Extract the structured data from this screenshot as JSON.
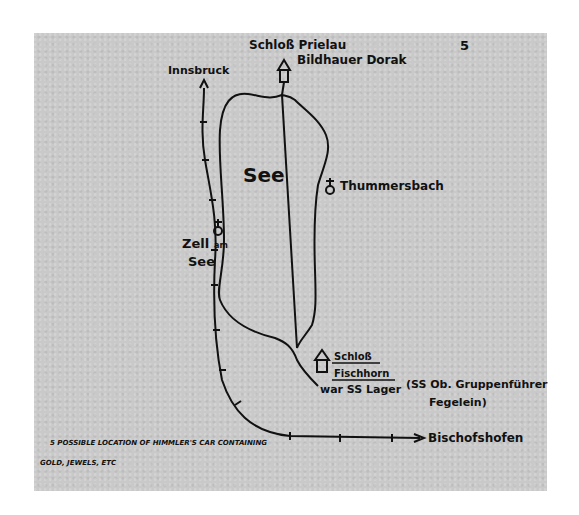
{
  "map": {
    "lake_label": "See",
    "page_mark": "5",
    "places": {
      "schloss_prielau": "Schloß Prielau",
      "bildhauer_dorak": "Bildhauer Dorak",
      "innsbruck": "Innsbruck",
      "thummersbach": "Thummersbach",
      "zell_am_see_line1": "Zell",
      "zell_am_see_am": "am",
      "zell_am_see_line2": "See",
      "schloss_fischhorn_line1": "Schloß",
      "schloss_fischhorn_line2": "Fischhorn",
      "ss_lager": "war SS Lager",
      "fegelein_line1": "(SS Ob. Gruppenführer",
      "fegelein_line2": "Fegelein)",
      "bischofshofen": "Bischofshofen"
    },
    "footnote_line1": "5 POSSIBLE LOCATION OF HIMMLER'S CAR CONTAINING",
    "footnote_line2": "GOLD, JEWELS, ETC",
    "colors": {
      "paper": "#c9c9c9",
      "ink": "#111111",
      "background": "#ffffff"
    },
    "icons": [
      "house-icon",
      "church-icon",
      "railway-line",
      "arrow-icon"
    ]
  }
}
